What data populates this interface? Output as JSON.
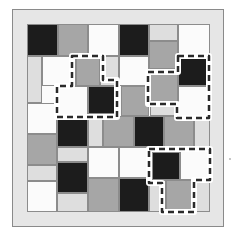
{
  "puzzle": {
    "colors": {
      "black": "#1c1c1c",
      "gray": "#a6a6a6",
      "light": "#dedede",
      "white": "#fbfbfb",
      "frame": "#e6e6e6",
      "dash": "#2a2a2a"
    },
    "cells": [
      {
        "x": 27,
        "y": 24,
        "w": 31,
        "h": 32,
        "c": "black"
      },
      {
        "x": 58,
        "y": 24,
        "w": 30,
        "h": 32,
        "c": "gray"
      },
      {
        "x": 88,
        "y": 24,
        "w": 31,
        "h": 32,
        "c": "white"
      },
      {
        "x": 119,
        "y": 24,
        "w": 30,
        "h": 32,
        "c": "black"
      },
      {
        "x": 149,
        "y": 24,
        "w": 29,
        "h": 17,
        "c": "light"
      },
      {
        "x": 149,
        "y": 41,
        "w": 29,
        "h": 28,
        "c": "gray"
      },
      {
        "x": 178,
        "y": 24,
        "w": 32,
        "h": 32,
        "c": "white"
      },
      {
        "x": 27,
        "y": 56,
        "w": 15,
        "h": 47,
        "c": "light"
      },
      {
        "x": 42,
        "y": 56,
        "w": 34,
        "h": 30,
        "c": "white"
      },
      {
        "x": 76,
        "y": 58,
        "w": 24,
        "h": 28,
        "c": "gray"
      },
      {
        "x": 100,
        "y": 56,
        "w": 19,
        "h": 30,
        "c": "light"
      },
      {
        "x": 119,
        "y": 56,
        "w": 30,
        "h": 30,
        "c": "white"
      },
      {
        "x": 178,
        "y": 58,
        "w": 30,
        "h": 28,
        "c": "black"
      },
      {
        "x": 57,
        "y": 86,
        "w": 31,
        "h": 30,
        "c": "white"
      },
      {
        "x": 88,
        "y": 86,
        "w": 28,
        "h": 28,
        "c": "black"
      },
      {
        "x": 121,
        "y": 86,
        "w": 28,
        "h": 30,
        "c": "gray"
      },
      {
        "x": 150,
        "y": 72,
        "w": 28,
        "h": 30,
        "c": "gray"
      },
      {
        "x": 150,
        "y": 102,
        "w": 28,
        "h": 14,
        "c": "light"
      },
      {
        "x": 178,
        "y": 86,
        "w": 30,
        "h": 30,
        "c": "white"
      },
      {
        "x": 27,
        "y": 103,
        "w": 30,
        "h": 31,
        "c": "white"
      },
      {
        "x": 57,
        "y": 116,
        "w": 31,
        "h": 31,
        "c": "black"
      },
      {
        "x": 88,
        "y": 116,
        "w": 15,
        "h": 31,
        "c": "light"
      },
      {
        "x": 103,
        "y": 116,
        "w": 31,
        "h": 31,
        "c": "gray"
      },
      {
        "x": 134,
        "y": 116,
        "w": 30,
        "h": 31,
        "c": "black"
      },
      {
        "x": 164,
        "y": 116,
        "w": 30,
        "h": 31,
        "c": "gray"
      },
      {
        "x": 194,
        "y": 116,
        "w": 16,
        "h": 31,
        "c": "light"
      },
      {
        "x": 27,
        "y": 134,
        "w": 30,
        "h": 31,
        "c": "gray"
      },
      {
        "x": 57,
        "y": 147,
        "w": 31,
        "h": 15,
        "c": "light"
      },
      {
        "x": 88,
        "y": 147,
        "w": 31,
        "h": 31,
        "c": "white"
      },
      {
        "x": 119,
        "y": 147,
        "w": 31,
        "h": 31,
        "c": "white"
      },
      {
        "x": 152,
        "y": 152,
        "w": 28,
        "h": 28,
        "c": "black"
      },
      {
        "x": 180,
        "y": 150,
        "w": 30,
        "h": 30,
        "c": "white"
      },
      {
        "x": 27,
        "y": 165,
        "w": 30,
        "h": 16,
        "c": "light"
      },
      {
        "x": 57,
        "y": 162,
        "w": 31,
        "h": 31,
        "c": "black"
      },
      {
        "x": 27,
        "y": 181,
        "w": 30,
        "h": 31,
        "c": "white"
      },
      {
        "x": 57,
        "y": 193,
        "w": 31,
        "h": 19,
        "c": "light"
      },
      {
        "x": 88,
        "y": 178,
        "w": 31,
        "h": 34,
        "c": "gray"
      },
      {
        "x": 119,
        "y": 178,
        "w": 30,
        "h": 34,
        "c": "black"
      },
      {
        "x": 149,
        "y": 180,
        "w": 17,
        "h": 32,
        "c": "light"
      },
      {
        "x": 166,
        "y": 180,
        "w": 26,
        "h": 30,
        "c": "gray"
      },
      {
        "x": 192,
        "y": 180,
        "w": 18,
        "h": 32,
        "c": "light"
      }
    ],
    "highlight_regions": [
      {
        "name": "region-left",
        "points": "72,56 103,56 103,80 117,80 117,117 57,117 57,86 72,86"
      },
      {
        "name": "region-top-right",
        "points": "178,56 209,56 209,118 177,118 177,104 148,104 148,72 178,72"
      },
      {
        "name": "region-bottom-right",
        "points": "149,149 210,149 210,180 194,180 194,212 162,212 162,183 149,183"
      }
    ]
  }
}
